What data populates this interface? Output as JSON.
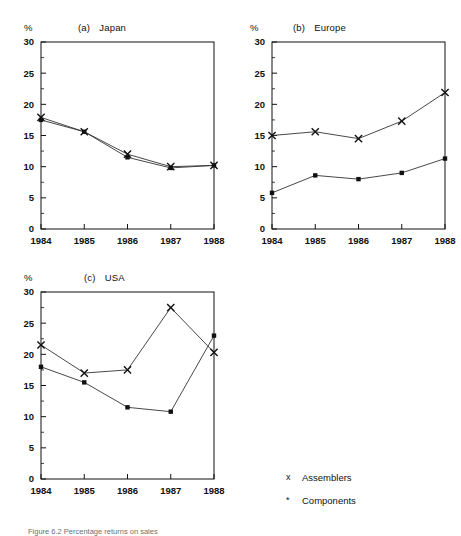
{
  "figure": {
    "unit_label": "%",
    "caption": "Figure 6.2  Percentage returns on sales",
    "axis_color": "#111111",
    "line_color": "#333333"
  },
  "legend": {
    "items": [
      {
        "marker": "x",
        "label": "Assemblers"
      },
      {
        "marker": "*",
        "label": "Components"
      }
    ]
  },
  "chart_data": [
    {
      "type": "line",
      "title": "(a)   Japan",
      "tag": "(a)",
      "name": "Japan",
      "xlabel": "",
      "ylabel": "%",
      "x": [
        "1984",
        "1985",
        "1986",
        "1987",
        "1988"
      ],
      "ylim": [
        0,
        30
      ],
      "yticks": [
        0,
        5,
        10,
        15,
        20,
        25,
        30
      ],
      "grid": false,
      "series": [
        {
          "name": "Assemblers",
          "marker": "x",
          "values": [
            17.9,
            15.6,
            12.0,
            10.0,
            10.2
          ]
        },
        {
          "name": "Components",
          "marker": "*",
          "values": [
            17.5,
            15.6,
            11.5,
            9.8,
            10.2
          ]
        }
      ]
    },
    {
      "type": "line",
      "title": "(b)   Europe",
      "tag": "(b)",
      "name": "Europe",
      "xlabel": "",
      "ylabel": "%",
      "x": [
        "1984",
        "1985",
        "1986",
        "1987",
        "1988"
      ],
      "ylim": [
        0,
        30
      ],
      "yticks": [
        0,
        5,
        10,
        15,
        20,
        25,
        30
      ],
      "grid": false,
      "series": [
        {
          "name": "Assemblers",
          "marker": "x",
          "values": [
            15.0,
            15.6,
            14.5,
            17.3,
            21.9
          ]
        },
        {
          "name": "Components",
          "marker": "*",
          "values": [
            5.8,
            8.6,
            8.0,
            9.0,
            11.3
          ]
        }
      ]
    },
    {
      "type": "line",
      "title": "(c)   USA",
      "tag": "(c)",
      "name": "USA",
      "xlabel": "",
      "ylabel": "%",
      "x": [
        "1984",
        "1985",
        "1986",
        "1987",
        "1988"
      ],
      "ylim": [
        0,
        30
      ],
      "yticks": [
        0,
        5,
        10,
        15,
        20,
        25,
        30
      ],
      "grid": false,
      "series": [
        {
          "name": "Assemblers",
          "marker": "x",
          "values": [
            21.5,
            17.0,
            17.5,
            27.5,
            20.3
          ]
        },
        {
          "name": "Components",
          "marker": "*",
          "values": [
            18.0,
            15.5,
            11.5,
            10.8,
            23.0
          ]
        }
      ]
    }
  ]
}
